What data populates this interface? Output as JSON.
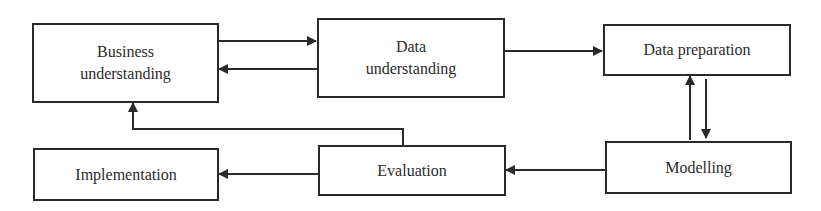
{
  "diagram": {
    "title": "",
    "colors": {
      "line": "#2a2a2a",
      "text": "#2b2b2b",
      "background": "#ffffff"
    },
    "nodes": [
      {
        "id": "business",
        "label_line1": "Business",
        "label_line2": "understanding"
      },
      {
        "id": "data_understanding",
        "label_line1": "Data",
        "label_line2": "understanding"
      },
      {
        "id": "data_preparation",
        "label": "Data preparation"
      },
      {
        "id": "modelling",
        "label": "Modelling"
      },
      {
        "id": "evaluation",
        "label": "Evaluation"
      },
      {
        "id": "implementation",
        "label": "Implementation"
      }
    ],
    "edges": [
      {
        "from": "business",
        "to": "data_understanding"
      },
      {
        "from": "data_understanding",
        "to": "business"
      },
      {
        "from": "data_understanding",
        "to": "data_preparation"
      },
      {
        "from": "data_preparation",
        "to": "modelling"
      },
      {
        "from": "modelling",
        "to": "data_preparation"
      },
      {
        "from": "modelling",
        "to": "evaluation"
      },
      {
        "from": "evaluation",
        "to": "implementation"
      },
      {
        "from": "evaluation",
        "to": "business"
      }
    ]
  }
}
